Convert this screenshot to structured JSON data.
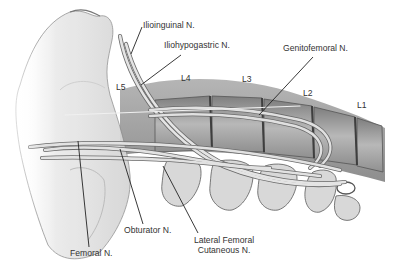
{
  "figure": {
    "colors": {
      "background": "#ffffff",
      "bone_light": "#e6e6e6",
      "bone_mid": "#c8c8c8",
      "bone_dark": "#8a8a8a",
      "muscle_band": "#9a9a9a",
      "nerve_fill": "#dedede",
      "nerve_stroke": "#6a6a6a",
      "leader_line": "#222222",
      "text": "#333333"
    },
    "labels": {
      "ilioinguinal": "Ilioinguinal N.",
      "iliohypogastric": "Iliohypogastric N.",
      "genitofemoral": "Genitofemoral N.",
      "obturator": "Obturator N.",
      "femoral": "Femoral N.",
      "lateral_femoral_line1": "Lateral Femoral",
      "lateral_femoral_line2": "Cutaneous N."
    },
    "vertebrae": {
      "l5": "L5",
      "l4": "L4",
      "l3": "L3",
      "l2": "L2",
      "l1": "L1"
    }
  }
}
